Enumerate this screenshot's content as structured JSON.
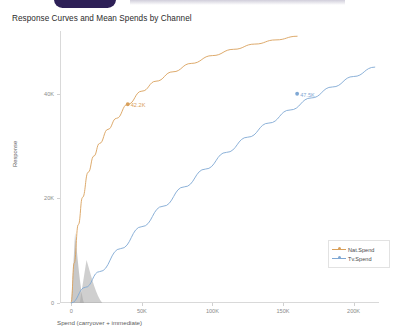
{
  "app_chrome": {
    "brand_pill": "brand-pill",
    "visible": true
  },
  "chart_data": {
    "type": "line",
    "title": "Response Curves and Mean Spends by Channel",
    "xlabel": "Spend (carryover + immediate)",
    "ylabel": "Response",
    "xlim": [
      -8000,
      218000
    ],
    "ylim": [
      0,
      52000
    ],
    "xticks": [
      0,
      50000,
      100000,
      150000,
      200000
    ],
    "xtick_labels": [
      "0",
      "50K",
      "100K",
      "150K",
      "200K"
    ],
    "yticks": [
      0,
      20000,
      40000
    ],
    "ytick_labels": [
      "0",
      "20K",
      "40K"
    ],
    "grid": false,
    "legend_position": "lower right",
    "series": [
      {
        "name": "Nat.Spend",
        "color": "#d9a05b",
        "mean_spend_label": "42.2K",
        "mean_spend_x": 40000,
        "mean_spend_y": 38000,
        "x": [
          0,
          2000,
          5000,
          8000,
          12000,
          16000,
          20000,
          26000,
          32000,
          40000,
          50000,
          60000,
          72000,
          85000,
          100000,
          115000,
          130000,
          145000,
          160000
        ],
        "y": [
          0,
          7600,
          15000,
          20200,
          25000,
          28100,
          30500,
          33200,
          35300,
          38000,
          40500,
          42400,
          44200,
          45800,
          47300,
          48500,
          49500,
          50300,
          51000
        ]
      },
      {
        "name": "Tv.Spend",
        "color": "#7fa8d4",
        "mean_spend_label": "47.5K",
        "mean_spend_x": 160000,
        "mean_spend_y": 40000,
        "x": [
          0,
          10000,
          20000,
          35000,
          50000,
          65000,
          80000,
          95000,
          110000,
          125000,
          140000,
          155000,
          170000,
          185000,
          200000,
          215000
        ],
        "y": [
          0,
          3000,
          6000,
          10400,
          14600,
          18500,
          22200,
          25600,
          28800,
          31700,
          34400,
          36900,
          39200,
          41300,
          43300,
          45100
        ]
      }
    ],
    "spend_distributions": [
      {
        "name": "Nat.Spend distribution",
        "color": "#9a9a9a",
        "x_start": 0,
        "x_end": 9000,
        "peak_y": 13500
      },
      {
        "name": "Tv.Spend distribution",
        "color": "#a8a8a8",
        "x_start": 6000,
        "x_end": 22000,
        "peak_y": 8200
      }
    ]
  }
}
